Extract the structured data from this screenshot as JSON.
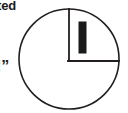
{
  "figure": {
    "name": "circle-quadrant-diagram",
    "type": "geometric-diagram",
    "background_color": "#ffffff",
    "stroke_color": "#231f20",
    "fill_color": "#1a1a1a",
    "circle": {
      "center_x": 69,
      "center_y": 59,
      "radius": 50,
      "stroke_width": 1.6
    },
    "radius_vertical": {
      "x1": 69,
      "y1": 9,
      "x2": 69,
      "y2": 61,
      "stroke_width": 1.8
    },
    "radius_horizontal": {
      "x1": 69,
      "y1": 61,
      "x2": 119,
      "y2": 61,
      "stroke_width": 1.8
    },
    "bar": {
      "x": 79,
      "y": 22,
      "width": 7,
      "height": 31,
      "stroke_width": 1
    }
  },
  "text_fragments": {
    "top_left": "ted",
    "mid_left": "!”"
  }
}
